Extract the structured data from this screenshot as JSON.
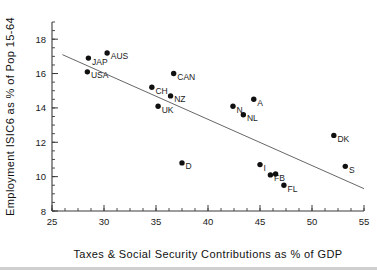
{
  "chart_data": {
    "type": "scatter",
    "title": "",
    "xlabel": "Taxes & Social Security Contributions as % of GDP",
    "ylabel": "Employment ISIC6 as % of Pop 15-64",
    "xlim": [
      25,
      55
    ],
    "ylim": [
      8,
      19
    ],
    "xticks": [
      25,
      30,
      35,
      40,
      45,
      50,
      55
    ],
    "xticklabels": [
      "25",
      "30",
      "35",
      "40",
      "45",
      "50",
      "55"
    ],
    "yticks": [
      8,
      10,
      12,
      14,
      16,
      18
    ],
    "yticklabels": [
      "8",
      "10",
      "12",
      "14",
      "16",
      "18"
    ],
    "x_minor_step": 1.25,
    "y_minor_step": 0.5,
    "grid": false,
    "legend": false,
    "points": [
      {
        "label": "JAP",
        "x": 28.5,
        "y": 16.9,
        "label_pos": "right-below"
      },
      {
        "label": "AUS",
        "x": 30.3,
        "y": 17.2,
        "label_pos": "right-below"
      },
      {
        "label": "USA",
        "x": 28.4,
        "y": 16.1,
        "label_pos": "right-below"
      },
      {
        "label": "CAN",
        "x": 36.7,
        "y": 16.0,
        "label_pos": "right-below"
      },
      {
        "label": "CH",
        "x": 34.6,
        "y": 15.2,
        "label_pos": "right-below"
      },
      {
        "label": "NZ",
        "x": 36.4,
        "y": 14.7,
        "label_pos": "right-below"
      },
      {
        "label": "UK",
        "x": 35.2,
        "y": 14.1,
        "label_pos": "right-below"
      },
      {
        "label": "A",
        "x": 44.4,
        "y": 14.5,
        "label_pos": "right-below"
      },
      {
        "label": "N",
        "x": 42.4,
        "y": 14.1,
        "label_pos": "right-below"
      },
      {
        "label": "NL",
        "x": 43.4,
        "y": 13.6,
        "label_pos": "right-below"
      },
      {
        "label": "D",
        "x": 37.5,
        "y": 10.8,
        "label_pos": "right-below"
      },
      {
        "label": "DK",
        "x": 52.1,
        "y": 12.4,
        "label_pos": "right-below"
      },
      {
        "label": "S",
        "x": 53.2,
        "y": 10.6,
        "label_pos": "right-below"
      },
      {
        "label": "I",
        "x": 45.0,
        "y": 10.7,
        "label_pos": "right-below"
      },
      {
        "label": "F",
        "x": 46.0,
        "y": 10.1,
        "label_pos": "right-below"
      },
      {
        "label": "B",
        "x": 46.5,
        "y": 10.15,
        "label_pos": "right-below"
      },
      {
        "label": "FL",
        "x": 47.3,
        "y": 9.5,
        "label_pos": "right-below"
      }
    ],
    "fit_line": {
      "x1": 26.0,
      "y1": 17.1,
      "x2": 55.0,
      "y2": 9.3
    },
    "colors": {
      "point": "#101010",
      "axis": "#3a3a3a",
      "fitline": "#555555",
      "text": "#1a1a1a",
      "background": "#ffffff",
      "footer_rule": "#cfcfcf"
    }
  }
}
